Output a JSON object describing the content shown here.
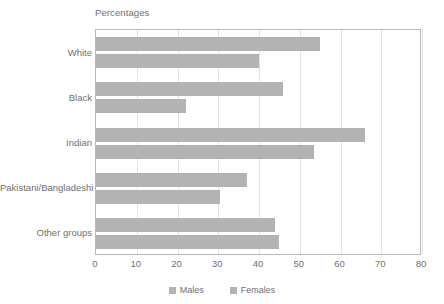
{
  "chart_data": {
    "type": "bar",
    "orientation": "horizontal",
    "title": "Percentages",
    "xlabel": "",
    "ylabel": "",
    "xlim": [
      0,
      80
    ],
    "xticks": [
      0,
      10,
      20,
      30,
      40,
      50,
      60,
      70,
      80
    ],
    "grid": "vertical",
    "legend_position": "bottom-center",
    "categories": [
      "White",
      "Black",
      "Indian",
      "Pakistani/Bangladeshi",
      "Other groups"
    ],
    "series": [
      {
        "name": "Males",
        "color": "#b3b3b3",
        "values": [
          55,
          46,
          66,
          37,
          44
        ]
      },
      {
        "name": "Females",
        "color": "#b3b3b3",
        "values": [
          40,
          22,
          53.5,
          30.5,
          45
        ]
      }
    ]
  },
  "colors": {
    "bar": "#b3b3b3",
    "gridline": "#e2e2e2",
    "axis": "#b9b9b9",
    "text": "#6f6f6f",
    "background": "#ffffff"
  }
}
